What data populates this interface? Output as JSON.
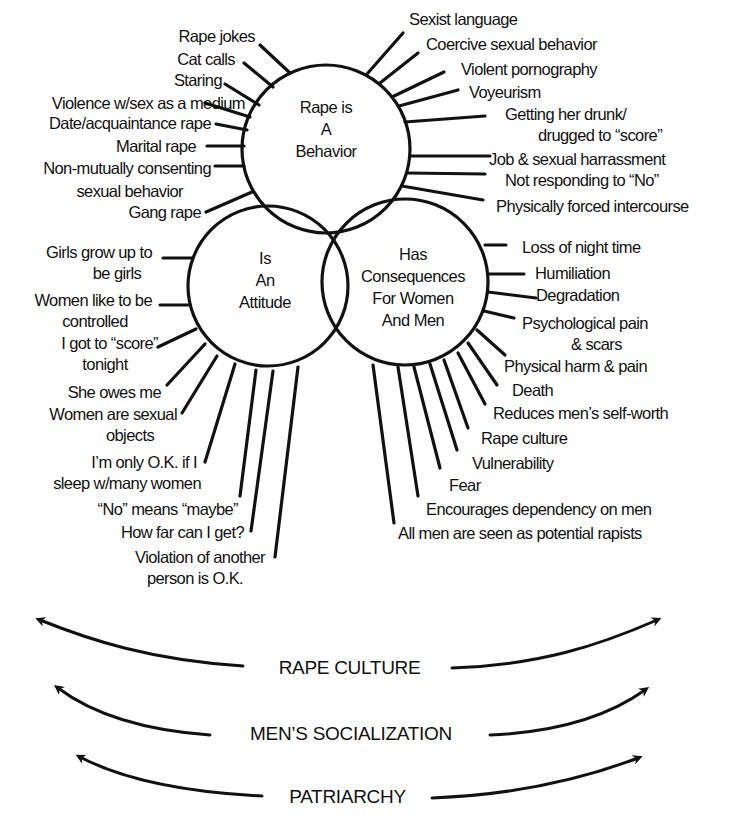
{
  "circles": {
    "behavior": {
      "label": "Rape is\nA\nBehavior"
    },
    "attitude": {
      "label": "Is\nAn\nAttitude"
    },
    "consequences": {
      "label": "Has\nConsequences\nFor Women\nAnd Men"
    }
  },
  "behaviors_left": [
    "Rape jokes",
    "Cat calls",
    "Staring",
    "Violence w/sex as a medium",
    "Date/acquaintance rape",
    "Marital rape",
    "Non-mutually consenting",
    "sexual behavior",
    "Gang rape"
  ],
  "behaviors_right": [
    "Sexist language",
    "Coercive sexual behavior",
    "Violent pornography",
    "Voyeurism",
    "Getting her drunk/",
    "drugged to “score”",
    "Job & sexual harrassment",
    "Not responding to “No”",
    "Physically forced intercourse"
  ],
  "attitudes": [
    "Girls grow up to",
    "be girls",
    "Women like to be",
    "controlled",
    "I got to “score”",
    "tonight",
    "She owes me",
    "Women are sexual",
    "objects",
    "I’m only O.K. if I",
    "sleep w/many women",
    "“No” means “maybe”",
    "How far can I get?",
    "Violation of another",
    "person is O.K."
  ],
  "consequences": [
    "Loss of night time",
    "Humiliation",
    "Degradation",
    "Psychological pain",
    "& scars",
    "Physical harm & pain",
    "Death",
    "Reduces men’s self-worth",
    "Rape culture",
    "Vulnerability",
    "Fear",
    "Encourages dependency on men",
    "All men are seen as potential rapists"
  ],
  "bands": [
    {
      "label": "RAPE CULTURE"
    },
    {
      "label": "MEN’S SOCIALIZATION"
    },
    {
      "label": "PATRIARCHY"
    }
  ],
  "colors": {
    "ink": "#111111",
    "background": "#ffffff"
  }
}
